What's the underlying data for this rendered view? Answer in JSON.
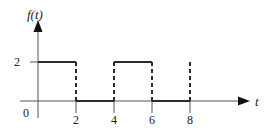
{
  "chart_data": {
    "type": "line",
    "title": "",
    "ylabel": "f(t)",
    "xlabel": "t",
    "origin_label": "0",
    "x_ticks": [
      2,
      4,
      6,
      8
    ],
    "x_tick_labels": [
      "2",
      "4",
      "6",
      "8"
    ],
    "y_ticks": [
      2
    ],
    "y_tick_labels": [
      "2"
    ],
    "xlim": [
      0,
      10.5
    ],
    "ylim": [
      0,
      4
    ],
    "grid": false,
    "legend": null,
    "segments": [
      {
        "x": [
          0,
          2
        ],
        "y": [
          2,
          2
        ]
      },
      {
        "x": [
          2,
          4
        ],
        "y": [
          0,
          0
        ]
      },
      {
        "x": [
          4,
          6
        ],
        "y": [
          2,
          2
        ]
      },
      {
        "x": [
          6,
          8
        ],
        "y": [
          0,
          0
        ]
      }
    ],
    "dashed_transitions": [
      2,
      4,
      6,
      8
    ],
    "series": [
      {
        "name": "f(t)",
        "x": [
          0,
          2,
          2,
          4,
          4,
          6,
          6,
          8
        ],
        "values": [
          2,
          2,
          0,
          0,
          2,
          2,
          0,
          0
        ]
      }
    ]
  },
  "colors": {
    "line": "#2a2a2a",
    "axis": "#555555",
    "text": "#222222",
    "background": "#ffffff"
  }
}
